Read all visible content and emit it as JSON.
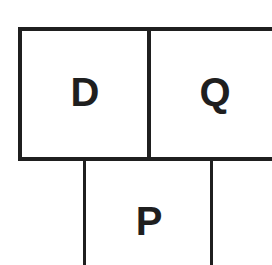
{
  "diagram": {
    "cells": [
      {
        "id": "D",
        "label": "D"
      },
      {
        "id": "Q",
        "label": "Q"
      },
      {
        "id": "P",
        "label": "P"
      }
    ],
    "colors": {
      "line": "#1f1f1f",
      "background": "#ffffff",
      "text": "#1f1f1f"
    }
  }
}
